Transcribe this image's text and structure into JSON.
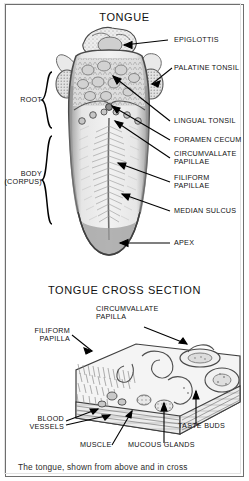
{
  "figure": {
    "top_title": "TONGUE",
    "bottom_title": "TONGUE CROSS SECTION",
    "caption": "The tongue, shown from above and in cross"
  },
  "tongue_labels": {
    "epiglottis": "EPIGLOTTIS",
    "palatine_tonsil": "PALATINE TONSIL",
    "lingual_tonsil": "LINGUAL TONSIL",
    "foramen_cecum": "FORAMEN CECUM",
    "circumvallate_papillae": "CIRCUMVALLATE\nPAPILLAE",
    "filiform_papillae": "FILIFORM\nPAPILLAE",
    "median_sulcus": "MEDIAN SULCUS",
    "apex": "APEX",
    "root": "ROOT",
    "body": "BODY\n(CORPUS)"
  },
  "cross_section_labels": {
    "circumvallate_papilla": "CIRCUMVALLATE\nPAPILLA",
    "filiform_papilla": "FILIFORM\nPAPILLA",
    "blood_vessels": "BLOOD\nVESSELS",
    "muscle": "MUSCLE",
    "mucous_glands": "MUCOUS GLANDS",
    "taste_buds": "TASTE BUDS"
  },
  "colors": {
    "ink": "#111111",
    "frame": "#6e6e6e",
    "tissue_light": "#d9d9d9",
    "tissue_mid": "#a8a8a8",
    "tissue_dark": "#6f6f6f",
    "page": "#ffffff"
  }
}
